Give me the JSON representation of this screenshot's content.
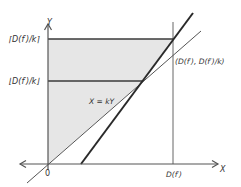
{
  "diagram": {
    "axes": {
      "x_label": "X",
      "y_label": "Y",
      "origin_label": "0"
    },
    "labels": {
      "ceil_label": "⌈D(f′)/k⌉",
      "floor_label": "⌊D(f′)/k⌋",
      "line_label": "X = kY",
      "point_label": "(D(f′), D(f′)/k)",
      "x_tick_label": "D(f′)"
    },
    "colors": {
      "shade": "#e6e6e6",
      "axis": "#555555",
      "thick_line": "#2a2a2a",
      "thin_line": "#555555",
      "text": "#333333"
    }
  }
}
